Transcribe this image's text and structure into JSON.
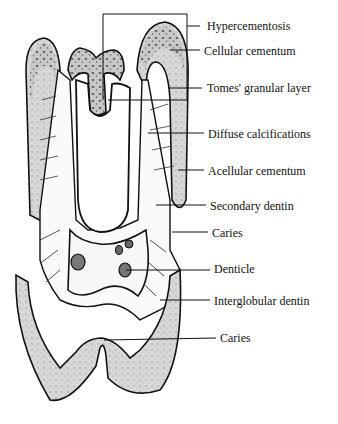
{
  "figure": {
    "labels": [
      {
        "id": "hypercementosis",
        "text": "Hypercementosis",
        "x": 207,
        "y": 19
      },
      {
        "id": "cellular-cementum",
        "text": "Cellular cementum",
        "x": 204,
        "y": 44
      },
      {
        "id": "tomes-granular-layer",
        "text": "Tomes' granular layer",
        "x": 207,
        "y": 81
      },
      {
        "id": "diffuse-calcifications",
        "text": "Diffuse calcifications",
        "x": 208,
        "y": 127
      },
      {
        "id": "acellular-cementum",
        "text": "Acellular cementum",
        "x": 208,
        "y": 164
      },
      {
        "id": "secondary-dentin",
        "text": "Secondary dentin",
        "x": 210,
        "y": 199
      },
      {
        "id": "caries-upper",
        "text": "Caries",
        "x": 212,
        "y": 226
      },
      {
        "id": "denticle",
        "text": "Denticle",
        "x": 214,
        "y": 262
      },
      {
        "id": "interglobular-dentin",
        "text": "Interglobular dentin",
        "x": 214,
        "y": 294
      },
      {
        "id": "caries-lower",
        "text": "Caries",
        "x": 220,
        "y": 331
      }
    ]
  }
}
